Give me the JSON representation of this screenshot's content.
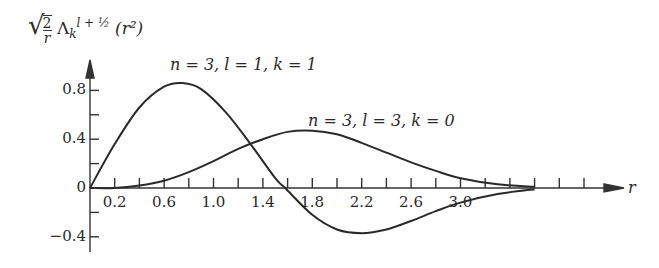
{
  "chart_data": {
    "type": "line",
    "title": "",
    "ylabel": "√(2/r) Λ_k^{l+1/2}(r²)",
    "xlabel": "r",
    "xlim": [
      0,
      3.8
    ],
    "ylim": [
      -0.45,
      0.95
    ],
    "x_tick_labels": [
      "0.2",
      "0.6",
      "1.0",
      "1.4",
      "1.8",
      "2.2",
      "2.6",
      "3.0"
    ],
    "y_tick_labels": [
      "0.8",
      "0.4",
      "0",
      "−0.4"
    ],
    "grid": false,
    "legend": "inline annotations",
    "series": [
      {
        "name": "n = 3, l = 1, k = 1",
        "x": [
          0,
          0.2,
          0.4,
          0.6,
          0.75,
          0.9,
          1.1,
          1.3,
          1.5,
          1.58,
          1.8,
          2.0,
          2.2,
          2.4,
          2.6,
          2.8,
          3.0,
          3.3,
          3.6
        ],
        "y": [
          0,
          0.36,
          0.66,
          0.83,
          0.86,
          0.81,
          0.62,
          0.36,
          0.08,
          0,
          -0.22,
          -0.34,
          -0.37,
          -0.34,
          -0.27,
          -0.19,
          -0.12,
          -0.05,
          -0.01
        ]
      },
      {
        "name": "n = 3, l = 3, k = 0",
        "x": [
          0,
          0.2,
          0.4,
          0.6,
          0.8,
          1.0,
          1.2,
          1.4,
          1.6,
          1.8,
          2.0,
          2.2,
          2.4,
          2.6,
          2.8,
          3.0,
          3.3,
          3.6
        ],
        "y": [
          0,
          0.0,
          0.02,
          0.06,
          0.13,
          0.22,
          0.32,
          0.4,
          0.46,
          0.47,
          0.44,
          0.37,
          0.29,
          0.21,
          0.14,
          0.08,
          0.03,
          0.01
        ]
      }
    ]
  },
  "labels": {
    "ylabel_sqrt": "√",
    "ylabel_num": "2",
    "ylabel_den": "r",
    "ylabel_lambda": "Λ",
    "ylabel_sub": "k",
    "ylabel_sup": "l + ½",
    "ylabel_arg": "(r²)",
    "xlabel": "r",
    "series1": "n = 3, l = 1, k = 1",
    "series2": "n = 3, l = 3, k = 0"
  }
}
